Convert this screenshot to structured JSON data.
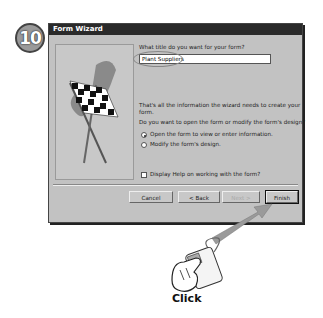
{
  "step": {
    "number": "10"
  },
  "window": {
    "title": "Form Wizard",
    "title_prompt": "What title do you want for your form?",
    "title_value": "Plant Suppliers",
    "info_line1": "That's all the information the wizard needs to create your",
    "info_line2": "form.",
    "question": "Do you want to open the form or modify the form's design?",
    "options": [
      {
        "label": "Open the form to view or enter information.",
        "selected": true
      },
      {
        "label": "Modify the form's design.",
        "selected": false
      }
    ],
    "help_checkbox": {
      "label": "Display Help on working with the form?",
      "checked": false
    },
    "buttons": {
      "cancel": "Cancel",
      "back": "< Back",
      "next": "Next >",
      "finish": "Finish"
    }
  },
  "callout": {
    "action": "Click"
  }
}
